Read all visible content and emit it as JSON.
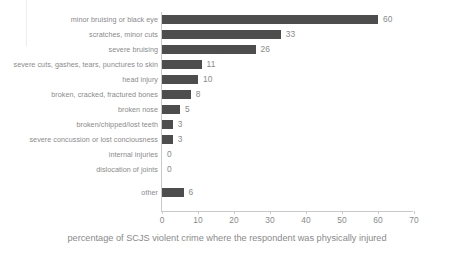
{
  "chart_data": {
    "type": "bar",
    "orientation": "horizontal",
    "title": "",
    "subtitle": "",
    "xlabel": "percentage of SCJS violent crime where the respondent was physically injured",
    "ylabel": "",
    "xlim": [
      0,
      70
    ],
    "ylim": null,
    "grid": false,
    "legend": null,
    "legend_position": "none",
    "bar_color": "#4d4d4d",
    "axis_color": "#c9c9c9",
    "text_color": "#8a8a8a",
    "background": "#ffffff",
    "categories": [
      "minor bruising or black eye",
      "scratches, minor cuts",
      "severe bruising",
      "severe cuts, gashes, tears, punctures to skin",
      "head injury",
      "broken, cracked, fractured bones",
      "broken nose",
      "broken/chipped/lost teeth",
      "severe concussion or lost conciousness",
      "internal injuries",
      "dislocation of joints",
      "other"
    ],
    "values": [
      60,
      33,
      26,
      11,
      10,
      8,
      5,
      3,
      3,
      0,
      0,
      6
    ],
    "value_labels": [
      "60",
      "33",
      "26",
      "11",
      "10",
      "8",
      "5",
      "3",
      "3",
      "0",
      "0",
      "6"
    ],
    "xticks": [
      0,
      10,
      20,
      30,
      40,
      50,
      60,
      70
    ],
    "xtick_labels": [
      "0",
      "10",
      "20",
      "30",
      "40",
      "50",
      "60",
      "70"
    ]
  }
}
